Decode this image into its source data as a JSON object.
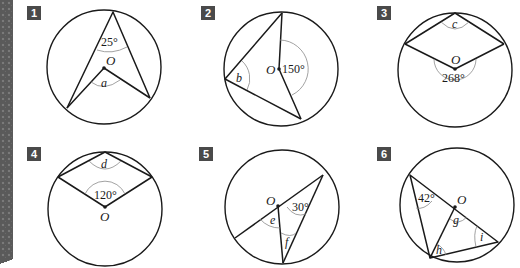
{
  "problems": [
    {
      "number": "1",
      "given_angle": "25°",
      "unknown": "a",
      "center_label": "O"
    },
    {
      "number": "2",
      "given_angle": "150°",
      "unknown": "b",
      "center_label": "O"
    },
    {
      "number": "3",
      "given_angle": "268°",
      "unknown": "c",
      "center_label": "O"
    },
    {
      "number": "4",
      "given_angle": "120°",
      "unknown": "d",
      "center_label": "O"
    },
    {
      "number": "5",
      "given_angle": "30°",
      "unknowns": [
        "e",
        "f"
      ],
      "center_label": "O"
    },
    {
      "number": "6",
      "given_angle": "42°",
      "unknowns": [
        "g",
        "h",
        "i"
      ],
      "center_label": "O"
    }
  ],
  "colors": {
    "line": "#1a1a1a",
    "arc": "#8a8a8a",
    "badge_bg": "#4a4a4a",
    "badge_text": "#ffffff",
    "edge_strip": "#5a5a5a"
  }
}
